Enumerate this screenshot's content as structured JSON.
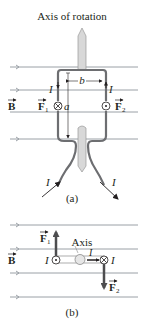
{
  "figure_a": {
    "title": "Axis of rotation",
    "field_label": "B",
    "force1_label": "F",
    "force1_sub": "1",
    "force2_label": "F",
    "force2_sub": "2",
    "current_label": "I",
    "width_label": "b",
    "height_label": "a",
    "caption": "(a)"
  },
  "figure_b": {
    "field_label": "B",
    "axis_label": "Axis",
    "force1_label": "F",
    "force1_sub": "1",
    "force2_label": "F",
    "force2_sub": "2",
    "current_label": "I",
    "caption": "(b)"
  },
  "colors": {
    "field_line": "#9aa0a6",
    "wire": "#6d6e71",
    "shaft": "#d8d8d8",
    "text": "#231f20",
    "force_arrow": "#4d4d4f"
  }
}
